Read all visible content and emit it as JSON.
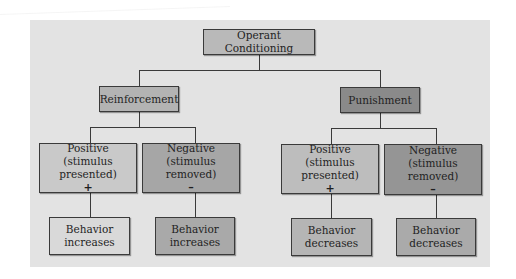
{
  "diagram": {
    "root": {
      "label": "Operant Conditioning",
      "color": "#b9b9b9"
    },
    "branches": [
      {
        "label": "Reinforcement",
        "color": "#b3b3b3",
        "children": [
          {
            "title": "Positive",
            "subtitle": "(stimulus presented)",
            "sign": "+",
            "color": "#c9c9c9",
            "outcome": {
              "line1": "Behavior",
              "line2": "increases",
              "color": "#d9d9d9"
            }
          },
          {
            "title": "Negative",
            "subtitle": "(stimulus removed)",
            "sign": "–",
            "color": "#a6a6a6",
            "outcome": {
              "line1": "Behavior",
              "line2": "increases",
              "color": "#a9a9a9"
            }
          }
        ]
      },
      {
        "label": "Punishment",
        "color": "#8a8a8a",
        "children": [
          {
            "title": "Positive",
            "subtitle": "(stimulus presented)",
            "sign": "+",
            "color": "#bdbdbd",
            "outcome": {
              "line1": "Behavior",
              "line2": "decreases",
              "color": "#b5b5b5"
            }
          },
          {
            "title": "Negative",
            "subtitle": "(stimulus removed)",
            "sign": "–",
            "color": "#959595",
            "outcome": {
              "line1": "Behavior",
              "line2": "decreases",
              "color": "#aaaaaa"
            }
          }
        ]
      }
    ]
  }
}
